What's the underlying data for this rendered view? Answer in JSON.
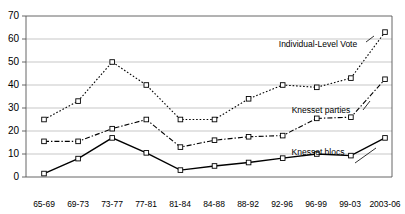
{
  "chart_data": {
    "type": "line",
    "title": "",
    "xlabel": "",
    "ylabel": "",
    "ylim": [
      0,
      70
    ],
    "ytick_step": 10,
    "yticks": [
      "0",
      "10",
      "20",
      "30",
      "40",
      "50",
      "60",
      "70"
    ],
    "grid": true,
    "legend_position": "inline-annotations",
    "categories": [
      "65-69",
      "69-73",
      "73-77",
      "77-81",
      "81-84",
      "84-88",
      "88-92",
      "92-96",
      "96-99",
      "99-03",
      "2003-06"
    ],
    "series": [
      {
        "name": "Individual-Level Vote",
        "style": "dotted",
        "marker": "square",
        "values": [
          25,
          33,
          50,
          40,
          25,
          25,
          34,
          40,
          39,
          43,
          63
        ]
      },
      {
        "name": "Knesset parties",
        "style": "dash-dot",
        "marker": "square",
        "values": [
          15.5,
          15.5,
          21,
          25,
          13,
          16,
          17.5,
          18,
          25.5,
          26,
          42.5
        ]
      },
      {
        "name": "Knesset blocs",
        "style": "solid",
        "marker": "square",
        "values": [
          1.5,
          8,
          17,
          10.5,
          3,
          4.8,
          6.3,
          8.2,
          10,
          9.3,
          17
        ]
      }
    ],
    "annotations": [
      {
        "text": "Individual-Level Vote",
        "series": "Individual-Level Vote"
      },
      {
        "text": "Knesset parties",
        "series": "Knesset parties"
      },
      {
        "text": "Knesset blocs",
        "series": "Knesset blocs"
      }
    ],
    "colors": {
      "line": "#000000",
      "grid": "#b0b0b0",
      "axis": "#555555",
      "marker_fill": "#ffffff",
      "background": "#ffffff"
    }
  }
}
